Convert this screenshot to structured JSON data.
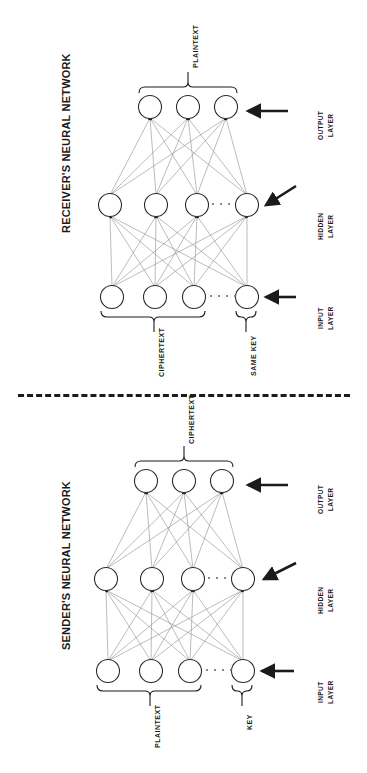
{
  "diagram": {
    "type": "neural-network-cryptography-architecture",
    "divider": "dashed-separator"
  },
  "receiver": {
    "title": "RECEIVER'S NEURAL NETWORK",
    "top_brace_label": "PLAINTEXT",
    "bottom_brace_labels": {
      "main": "CIPHERTEXT",
      "key": "SAME KEY"
    },
    "layers": [
      {
        "name": "output-layer",
        "label_line1": "OUTPUT",
        "label_line2": "LAYER",
        "nodes": 3,
        "has_ellipsis": false
      },
      {
        "name": "hidden-layer",
        "label_line1": "HIDDEN",
        "label_line2": "LAYER",
        "nodes": 4,
        "has_ellipsis": true
      },
      {
        "name": "input-layer",
        "label_line1": "INPUT",
        "label_line2": "LAYER",
        "nodes": 4,
        "has_ellipsis": true
      }
    ]
  },
  "sender": {
    "title": "SENDER'S NEURAL NETWORK",
    "top_brace_label": "CIPHERTEXT",
    "bottom_brace_labels": {
      "main": "PLAINTEXT",
      "key": "KEY"
    },
    "layers": [
      {
        "name": "output-layer",
        "label_line1": "OUTPUT",
        "label_line2": "LAYER",
        "nodes": 3,
        "has_ellipsis": false
      },
      {
        "name": "hidden-layer",
        "label_line1": "HIDDEN",
        "label_line2": "LAYER",
        "nodes": 4,
        "has_ellipsis": true
      },
      {
        "name": "input-layer",
        "label_line1": "INPUT",
        "label_line2": "LAYER",
        "nodes": 4,
        "has_ellipsis": true
      }
    ]
  },
  "style": {
    "ink": "#1b1b1b",
    "edge": "#8a8a8a",
    "node_stroke": "#2b2b2b",
    "background": "#ffffff"
  }
}
